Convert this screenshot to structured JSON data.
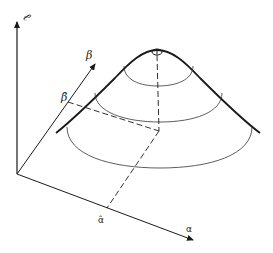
{
  "figure": {
    "colors": {
      "ink": "#1a1a1a",
      "background": "#ffffff"
    }
  },
  "axes": {
    "vertical_label": "ℓ",
    "beta_label": "β",
    "beta_hat_label": "β̂",
    "alpha_label": "α",
    "alpha_hat_label": "α̂"
  },
  "contours": {
    "count": 3
  }
}
